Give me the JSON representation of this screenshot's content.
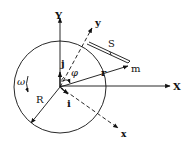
{
  "diagram": {
    "title": "",
    "colors": {
      "ink": "#111111",
      "background": "#ffffff"
    },
    "labels": {
      "Y_axis": "Y",
      "X_axis": "X",
      "y_axis": "y",
      "x_axis": "x",
      "unit_j": "j",
      "unit_i": "i",
      "angle": "φ",
      "radius_vector": "r",
      "mass": "m",
      "arc": "S",
      "radius": "R",
      "angular_velocity": "ω"
    },
    "elements": [
      {
        "id": "circle",
        "type": "circle",
        "description": "rotating disk of radius R centered at origin"
      },
      {
        "id": "Y-axis",
        "type": "axis",
        "style": "solid",
        "direction": "up"
      },
      {
        "id": "X-axis",
        "type": "axis",
        "style": "solid",
        "direction": "right"
      },
      {
        "id": "y-axis",
        "type": "axis",
        "style": "dashed",
        "direction": "up-right"
      },
      {
        "id": "x-axis",
        "type": "axis",
        "style": "dashed",
        "direction": "down-right"
      },
      {
        "id": "r-vector",
        "type": "vector",
        "from": "origin",
        "to": "m"
      },
      {
        "id": "S-string",
        "type": "segment",
        "style": "double-line",
        "from": "circle-tangent-point",
        "to": "m"
      },
      {
        "id": "R-vector",
        "type": "vector",
        "from": "origin",
        "to": "circle-edge-lower-left"
      },
      {
        "id": "omega-arrow",
        "type": "curved-arrow",
        "direction": "counterclockwise-down"
      },
      {
        "id": "phi-arc",
        "type": "angle-arc",
        "between": [
          "y-axis",
          "r-vector"
        ]
      }
    ]
  }
}
